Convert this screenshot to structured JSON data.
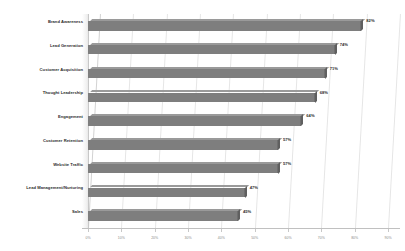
{
  "chart_data": {
    "type": "bar",
    "orientation": "horizontal",
    "title": "",
    "subtitle": "",
    "xlabel": "",
    "ylabel": "",
    "xlim": [
      0,
      90
    ],
    "grid": true,
    "legend": false,
    "style": "3d-horizontal-bar",
    "value_suffix": "%",
    "categories": [
      "Brand Awareness",
      "Lead Generation",
      "Customer Acquisition",
      "Thought Leadership",
      "Engagement",
      "Customer Retention",
      "Website Traffic",
      "Lead Management/Nurturing",
      "Sales"
    ],
    "values": [
      82,
      74,
      71,
      68,
      64,
      57,
      57,
      47,
      45
    ],
    "data_labels": [
      "82%",
      "74%",
      "71%",
      "68%",
      "64%",
      "57%",
      "57%",
      "47%",
      "45%"
    ],
    "xticks": [
      0,
      10,
      20,
      30,
      40,
      50,
      60,
      70,
      80,
      90
    ],
    "xtick_labels": [
      "0%",
      "10%",
      "20%",
      "30%",
      "40%",
      "50%",
      "60%",
      "70%",
      "80%",
      "90%"
    ],
    "colors": {
      "bar_front": "#7e7e7e",
      "bar_top": "#9a9a9a",
      "bar_side": "#5f5f5f",
      "gridline": "#e6e6e6",
      "label_text": "#2b2b2b",
      "tick_text": "#8a8a8a",
      "background": "#ffffff"
    }
  }
}
